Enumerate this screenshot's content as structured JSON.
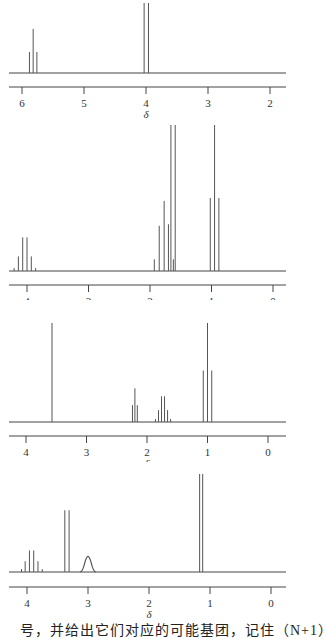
{
  "chart_data": [
    {
      "type": "nmr-spectrum",
      "panel": 1,
      "xlabel": "δ",
      "xlim": [
        6.2,
        1.8
      ],
      "ticks": [
        6,
        5,
        4,
        3,
        2
      ],
      "peaks": [
        {
          "shift": 5.88,
          "height": 0.3
        },
        {
          "shift": 5.82,
          "height": 0.63
        },
        {
          "shift": 5.76,
          "height": 0.3
        },
        {
          "shift": 4.03,
          "height": 1.0
        },
        {
          "shift": 3.96,
          "height": 1.0
        }
      ],
      "layout": {
        "top": 0,
        "height": 118,
        "baseline_y": 73,
        "axis_y": 87,
        "x_at_first_tick": 22,
        "px_per_unit": 62,
        "peak_full_height": 70
      }
    },
    {
      "type": "nmr-spectrum",
      "panel": 2,
      "xlabel": "δ",
      "xlim": [
        4.3,
        -0.2
      ],
      "ticks": [
        4,
        3,
        2,
        1,
        0
      ],
      "peaks": [
        {
          "shift": 4.21,
          "height": 0.02
        },
        {
          "shift": 4.14,
          "height": 0.1
        },
        {
          "shift": 4.07,
          "height": 0.23
        },
        {
          "shift": 4.0,
          "height": 0.23
        },
        {
          "shift": 3.93,
          "height": 0.1
        },
        {
          "shift": 3.86,
          "height": 0.02
        },
        {
          "shift": 1.93,
          "height": 0.08
        },
        {
          "shift": 1.85,
          "height": 0.31
        },
        {
          "shift": 1.77,
          "height": 0.48
        },
        {
          "shift": 1.7,
          "height": 0.32
        },
        {
          "shift": 1.66,
          "height": 1.0
        },
        {
          "shift": 1.62,
          "height": 0.08
        },
        {
          "shift": 1.59,
          "height": 1.0
        },
        {
          "shift": 1.02,
          "height": 0.5
        },
        {
          "shift": 0.95,
          "height": 1.0
        },
        {
          "shift": 0.88,
          "height": 0.5
        }
      ],
      "layout": {
        "top": 120,
        "height": 180,
        "baseline_y": 151,
        "axis_y": 165,
        "x_at_first_tick": 27,
        "px_per_unit": 61.5,
        "peak_full_height": 146
      }
    },
    {
      "type": "nmr-spectrum",
      "panel": 3,
      "xlabel": "δ",
      "xlim": [
        4.3,
        -0.2
      ],
      "ticks": [
        4,
        3,
        2,
        1,
        0
      ],
      "peaks": [
        {
          "shift": 3.57,
          "height": 1.0
        },
        {
          "shift": 2.24,
          "height": 0.17
        },
        {
          "shift": 2.2,
          "height": 0.34
        },
        {
          "shift": 2.16,
          "height": 0.17
        },
        {
          "shift": 1.86,
          "height": 0.03
        },
        {
          "shift": 1.81,
          "height": 0.12
        },
        {
          "shift": 1.76,
          "height": 0.26
        },
        {
          "shift": 1.71,
          "height": 0.26
        },
        {
          "shift": 1.66,
          "height": 0.12
        },
        {
          "shift": 1.61,
          "height": 0.03
        },
        {
          "shift": 1.07,
          "height": 0.52
        },
        {
          "shift": 1.0,
          "height": 1.0
        },
        {
          "shift": 0.93,
          "height": 0.52
        }
      ],
      "layout": {
        "top": 316,
        "height": 146,
        "baseline_y": 106,
        "axis_y": 120,
        "x_at_first_tick": 26,
        "px_per_unit": 60.5,
        "peak_full_height": 99
      }
    },
    {
      "type": "nmr-spectrum",
      "panel": 4,
      "xlabel": "δ",
      "xlim": [
        4.3,
        -0.2
      ],
      "ticks": [
        4,
        3,
        2,
        1,
        0
      ],
      "peaks": [
        {
          "shift": 4.09,
          "height": 0.03
        },
        {
          "shift": 4.03,
          "height": 0.11
        },
        {
          "shift": 3.96,
          "height": 0.22
        },
        {
          "shift": 3.89,
          "height": 0.22
        },
        {
          "shift": 3.82,
          "height": 0.11
        },
        {
          "shift": 3.75,
          "height": 0.03
        },
        {
          "shift": 3.38,
          "height": 0.63
        },
        {
          "shift": 3.31,
          "height": 0.63
        },
        {
          "shift": 1.17,
          "height": 1.0
        },
        {
          "shift": 1.12,
          "height": 1.0
        }
      ],
      "broad_peaks": [
        {
          "shift": 3.0,
          "height": 0.16,
          "width": 0.08
        }
      ],
      "layout": {
        "top": 472,
        "height": 150,
        "baseline_y": 100,
        "axis_y": 115,
        "x_at_first_tick": 27,
        "px_per_unit": 61,
        "peak_full_height": 98
      }
    }
  ],
  "caption": {
    "text": "号，并给出它们对应的可能基团，记住（N+1）"
  },
  "axis_symbol": "δ",
  "colors": {
    "line": "#444444",
    "peak": "#555555",
    "text": "#333333"
  }
}
